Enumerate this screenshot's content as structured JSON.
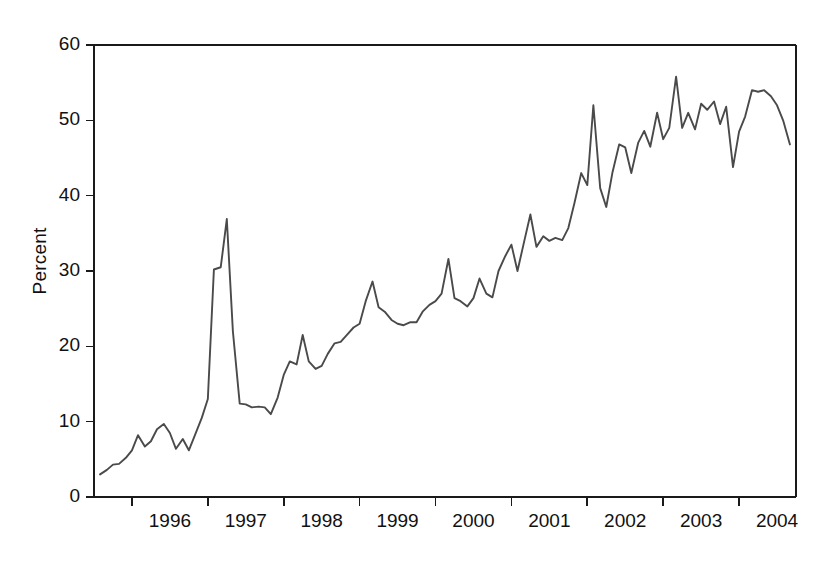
{
  "chart_data": {
    "type": "line",
    "title": "",
    "subtitle": "",
    "xlabel": "",
    "ylabel": "Percent",
    "grid": false,
    "legend": false,
    "legend_position": "none",
    "line_color": "#4a4a4a",
    "background_color": "#ffffff",
    "axis_color": "#1a1a1a",
    "xlim": [
      1995.5,
      2004.75
    ],
    "ylim": [
      0,
      60
    ],
    "yticks": [
      0,
      10,
      20,
      30,
      40,
      50,
      60
    ],
    "ytick_labels": [
      "0",
      "10",
      "20",
      "30",
      "40",
      "50",
      "60"
    ],
    "xticks": [
      1996,
      1997,
      1998,
      1999,
      2000,
      2001,
      2002,
      2003,
      2004,
      2005
    ],
    "xtick_labels": [
      "1996",
      "1997",
      "1998",
      "1999",
      "2000",
      "2001",
      "2002",
      "2003",
      "2004"
    ],
    "x_label_placement": "between-ticks",
    "x_units": "year (monthly observations)",
    "series": [
      {
        "name": "Percent",
        "color": "#4a4a4a",
        "x": [
          1995.58,
          1995.67,
          1995.75,
          1995.83,
          1995.92,
          1996.0,
          1996.08,
          1996.17,
          1996.25,
          1996.33,
          1996.42,
          1996.5,
          1996.58,
          1996.67,
          1996.75,
          1996.83,
          1996.92,
          1997.0,
          1997.08,
          1997.17,
          1997.25,
          1997.33,
          1997.42,
          1997.5,
          1997.58,
          1997.67,
          1997.75,
          1997.83,
          1997.92,
          1998.0,
          1998.08,
          1998.17,
          1998.25,
          1998.33,
          1998.42,
          1998.5,
          1998.58,
          1998.67,
          1998.75,
          1998.83,
          1998.92,
          1999.0,
          1999.08,
          1999.17,
          1999.25,
          1999.33,
          1999.42,
          1999.5,
          1999.58,
          1999.67,
          1999.75,
          1999.83,
          1999.92,
          2000.0,
          2000.08,
          2000.17,
          2000.25,
          2000.33,
          2000.42,
          2000.5,
          2000.58,
          2000.67,
          2000.75,
          2000.83,
          2000.92,
          2001.0,
          2001.08,
          2001.17,
          2001.25,
          2001.33,
          2001.42,
          2001.5,
          2001.58,
          2001.67,
          2001.75,
          2001.83,
          2001.92,
          2002.0,
          2002.08,
          2002.17,
          2002.25,
          2002.33,
          2002.42,
          2002.5,
          2002.58,
          2002.67,
          2002.75,
          2002.83,
          2002.92,
          2003.0,
          2003.08,
          2003.17,
          2003.25,
          2003.33,
          2003.42,
          2003.5,
          2003.58,
          2003.67,
          2003.75,
          2003.83,
          2003.92,
          2004.0,
          2004.08,
          2004.17,
          2004.25,
          2004.33,
          2004.42,
          2004.5,
          2004.58,
          2004.67
        ],
        "y": [
          3.0,
          3.6,
          4.3,
          4.4,
          5.2,
          6.2,
          8.2,
          6.7,
          7.4,
          9.0,
          9.7,
          8.5,
          6.4,
          7.7,
          6.2,
          8.2,
          10.5,
          13.0,
          30.2,
          30.5,
          36.9,
          22.0,
          12.4,
          12.3,
          11.9,
          12.0,
          11.9,
          11.0,
          13.2,
          16.2,
          18.0,
          17.6,
          21.5,
          18.0,
          17.0,
          17.4,
          19.0,
          20.4,
          20.6,
          21.5,
          22.5,
          23.0,
          26.0,
          28.6,
          25.2,
          24.6,
          23.5,
          23.0,
          22.8,
          23.2,
          23.2,
          24.6,
          25.5,
          26.0,
          27.0,
          31.6,
          26.4,
          26.0,
          25.3,
          26.4,
          29.0,
          27.0,
          26.5,
          30.0,
          32.0,
          33.5,
          30.0,
          34.0,
          37.5,
          33.2,
          34.6,
          34.0,
          34.4,
          34.1,
          35.7,
          39.0,
          43.0,
          41.4,
          52.0,
          41.0,
          38.5,
          43.0,
          46.8,
          46.4,
          43.0,
          47.0,
          48.6,
          46.5,
          51.0,
          47.5,
          49.0,
          55.8,
          49.0,
          51.0,
          48.8,
          52.2,
          51.4,
          52.5,
          49.5,
          51.8,
          43.8,
          48.5,
          50.5,
          54.0,
          53.8,
          54.0,
          53.2,
          52.0,
          50.0,
          46.8
        ]
      }
    ]
  },
  "axis": {
    "ylabel_text": "Percent"
  }
}
